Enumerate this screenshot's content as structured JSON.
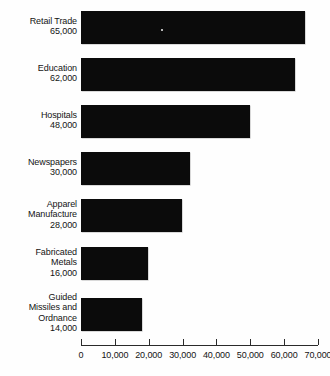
{
  "chart_data": {
    "type": "bar",
    "orientation": "horizontal",
    "title": "",
    "xlabel": "",
    "ylabel": "",
    "xlim": [
      0,
      70000
    ],
    "grid": false,
    "legend": null,
    "categories": [
      "Retail Trade",
      "Education",
      "Hospitals",
      "Newspapers",
      "Apparel Manufacture",
      "Fabricated Metals",
      "Guided Missiles and Ordnance"
    ],
    "values": [
      65000,
      62000,
      48000,
      30000,
      28000,
      16000,
      14000
    ],
    "data_labels": [
      "65,000",
      "62,000",
      "48,000",
      "30,000",
      "28,000",
      "16,000",
      "14,000"
    ],
    "xticks": [
      0,
      10000,
      20000,
      30000,
      40000,
      50000,
      60000,
      70000
    ],
    "xticklabels": [
      "0",
      "10,000",
      "20,000",
      "30,000",
      "40,000",
      "50,000",
      "60,000",
      "70,000"
    ],
    "bar_color": "#0b0b0b",
    "background_color": "#ffffff"
  },
  "bars": [
    {
      "name_lines": [
        "Retail Trade"
      ],
      "value_label": "65,000",
      "value": 65000,
      "top": 11,
      "label_top": 16,
      "bar_width": 224
    },
    {
      "name_lines": [
        "Education"
      ],
      "value_label": "62,000",
      "value": 62000,
      "top": 58,
      "label_top": 63,
      "bar_width": 214
    },
    {
      "name_lines": [
        "Hospitals"
      ],
      "value_label": "48,000",
      "value": 48000,
      "top": 105,
      "label_top": 110,
      "bar_width": 169
    },
    {
      "name_lines": [
        "Newspapers"
      ],
      "value_label": "30,000",
      "value": 30000,
      "top": 152,
      "label_top": 157,
      "bar_width": 109
    },
    {
      "name_lines": [
        "Apparel",
        "Manufacture"
      ],
      "value_label": "28,000",
      "value": 28000,
      "top": 199,
      "label_top": 199,
      "bar_width": 101
    },
    {
      "name_lines": [
        "Fabricated",
        "Metals"
      ],
      "value_label": "16,000",
      "value": 16000,
      "top": 247,
      "label_top": 247,
      "bar_width": 67
    },
    {
      "name_lines": [
        "Guided",
        "Missiles and",
        "Ordnance"
      ],
      "value_label": "14,000",
      "value": 14000,
      "top": 298,
      "label_top": 292,
      "bar_width": 61
    }
  ],
  "axis": {
    "origin_x": 81,
    "px_per_unit": 0.0033857,
    "ticks": [
      {
        "label": "0",
        "x": 81
      },
      {
        "label": "10,000",
        "x": 114.9
      },
      {
        "label": "20,000",
        "x": 148.7
      },
      {
        "label": "30,000",
        "x": 182.6
      },
      {
        "label": "40,000",
        "x": 216.4
      },
      {
        "label": "50,000",
        "x": 250.3
      },
      {
        "label": "60,000",
        "x": 284.1
      },
      {
        "label": "70,000",
        "x": 318
      }
    ]
  }
}
